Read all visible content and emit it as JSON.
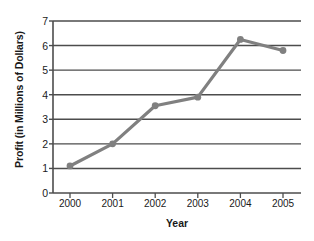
{
  "chart_data": {
    "type": "line",
    "title": "",
    "xlabel": "Year",
    "ylabel": "Profit (in Millions of Dollars)",
    "categories": [
      "2000",
      "2001",
      "2002",
      "2003",
      "2004",
      "2005"
    ],
    "values": [
      1.1,
      2.0,
      3.55,
      3.9,
      6.25,
      5.8
    ],
    "series": [
      {
        "name": "Profit",
        "values": [
          1.1,
          2.0,
          3.55,
          3.9,
          6.25,
          5.8
        ]
      }
    ],
    "ylim": [
      0,
      7
    ],
    "ytick_labels": [
      "0",
      "1",
      "2",
      "3",
      "4",
      "5",
      "6",
      "7"
    ],
    "ytick_values": [
      0,
      1,
      2,
      3,
      4,
      5,
      6,
      7
    ],
    "xtick_labels": [
      "2000",
      "2001",
      "2002",
      "2003",
      "2004",
      "2005"
    ],
    "grid": "horizontal",
    "legend": "none",
    "line_color": "#808080",
    "marker_color": "#808080",
    "grid_color": "#4d4d4d",
    "axis_color": "#4d4d4d",
    "background_color": "#ffffff"
  }
}
